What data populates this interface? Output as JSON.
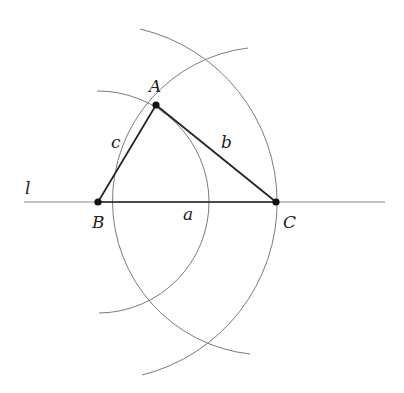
{
  "diagram": {
    "colors": {
      "edge": "#222222",
      "arc": "#7a7a7a",
      "line": "#8a8a8a",
      "point": "#111111"
    },
    "line": {
      "label": "l"
    },
    "points": {
      "A": {
        "label": "A",
        "x": 156,
        "y": 105
      },
      "B": {
        "label": "B",
        "x": 98,
        "y": 202
      },
      "C": {
        "label": "C",
        "x": 276,
        "y": 202
      }
    },
    "sides": {
      "a": {
        "label": "a",
        "from": "B",
        "to": "C"
      },
      "b": {
        "label": "b",
        "from": "A",
        "to": "C"
      },
      "c": {
        "label": "c",
        "from": "B",
        "to": "A"
      }
    },
    "arcs": [
      {
        "name": "arc-center-B-radius-c",
        "center": "B",
        "radius_label": "c"
      },
      {
        "name": "arc-center-C-radius-b",
        "center": "C",
        "radius_label": "b"
      },
      {
        "name": "arc-center-B-radius-a",
        "center": "B",
        "radius_label": "a"
      }
    ]
  }
}
